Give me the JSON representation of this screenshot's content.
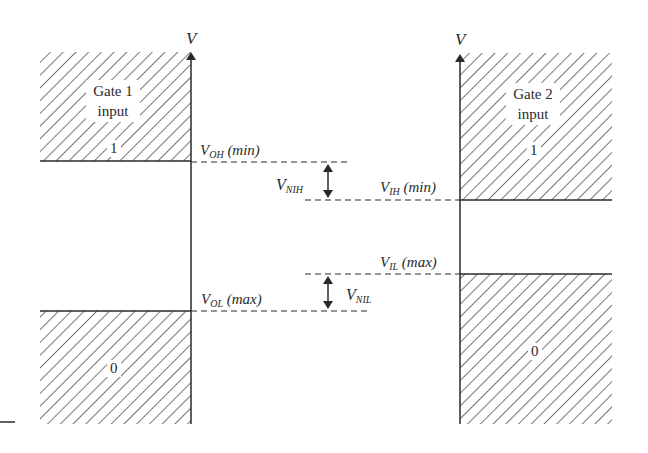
{
  "axis_label": "V",
  "gate1": {
    "label_line1": "Gate 1",
    "label_line2": "input",
    "high_region": "1",
    "low_region": "0"
  },
  "gate2": {
    "label_line1": "Gate 2",
    "label_line2": "input",
    "high_region": "1",
    "low_region": "0"
  },
  "levels": {
    "voh": {
      "base": "V",
      "sub": "OH",
      "qualifier": "(min)"
    },
    "vol": {
      "base": "V",
      "sub": "OL",
      "qualifier": "(max)"
    },
    "vih": {
      "base": "V",
      "sub": "IH",
      "qualifier": "(min)"
    },
    "vil": {
      "base": "V",
      "sub": "IL",
      "qualifier": "(max)"
    }
  },
  "margins": {
    "nih": {
      "base": "V",
      "sub": "NIH"
    },
    "nil": {
      "base": "V",
      "sub": "NIL"
    }
  },
  "colors": {
    "ink": "#2a2a2a",
    "background": "#ffffff"
  }
}
